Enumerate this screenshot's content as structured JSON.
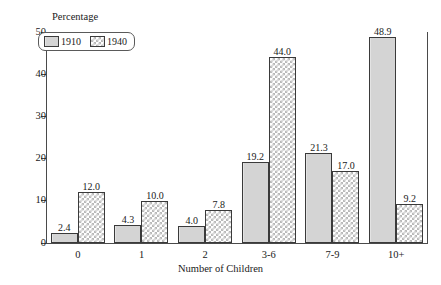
{
  "chart_data": {
    "type": "bar",
    "title": "",
    "xlabel": "Number of Children",
    "ylabel": "Percentage",
    "categories": [
      "0",
      "1",
      "2",
      "3-6",
      "7-9",
      "10+"
    ],
    "series": [
      {
        "name": "1910",
        "values": [
          2.4,
          4.3,
          4.0,
          19.2,
          21.3,
          48.9
        ],
        "fill": "solid-gray",
        "color": "#d4d4d4"
      },
      {
        "name": "1940",
        "values": [
          12.0,
          10.0,
          7.8,
          44.0,
          17.0,
          9.2
        ],
        "fill": "checkerboard",
        "color": "#b9b9b9"
      }
    ],
    "value_labels": [
      [
        "2.4",
        "12.0"
      ],
      [
        "4.3",
        "10.0"
      ],
      [
        "4.0",
        "7.8"
      ],
      [
        "19.2",
        "44.0"
      ],
      [
        "21.3",
        "17.0"
      ],
      [
        "48.9",
        "9.2"
      ]
    ],
    "ylim": [
      0,
      50
    ],
    "yticks": [
      0,
      10,
      20,
      30,
      40,
      50
    ],
    "ytick_labels": [
      "0",
      "10",
      "20",
      "30",
      "40",
      "50"
    ],
    "grid": false,
    "legend_position": "top-left",
    "legend_entries": [
      "1910",
      "1940"
    ]
  },
  "axes": {
    "y_title": "Percentage",
    "x_title": "Number of Children"
  }
}
